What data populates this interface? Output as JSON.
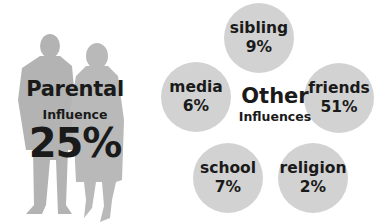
{
  "parental": {
    "title": "Parental",
    "subtitle": "Influence",
    "value": "25%"
  },
  "other": {
    "title": "Other",
    "subtitle": "Influences",
    "items": [
      {
        "label": "sibling",
        "value": "9%"
      },
      {
        "label": "media",
        "value": "6%"
      },
      {
        "label": "friends",
        "value": "51%"
      },
      {
        "label": "school",
        "value": "7%"
      },
      {
        "label": "religion",
        "value": "2%"
      }
    ]
  },
  "colors": {
    "silhouette": "#b3b3b3",
    "bubble": "#d2d2d2",
    "text": "#1a1a1a"
  }
}
